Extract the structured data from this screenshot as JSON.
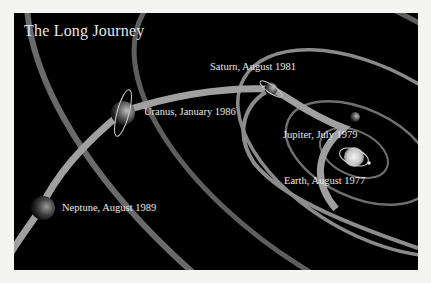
{
  "title": "The Long Journey",
  "colors": {
    "background": "#000000",
    "page": "#f4f4f2",
    "orbit": "#7a7a7a",
    "trajectory": "#a8a8a8",
    "text": "#e8e8e8"
  },
  "planets": [
    {
      "name": "Earth",
      "label": "Earth, August 1977"
    },
    {
      "name": "Jupiter",
      "label": "Jupiter, July 1979"
    },
    {
      "name": "Saturn",
      "label": "Saturn, August 1981"
    },
    {
      "name": "Uranus",
      "label": "Uranus, January 1986"
    },
    {
      "name": "Neptune",
      "label": "Neptune, August 1989"
    }
  ]
}
